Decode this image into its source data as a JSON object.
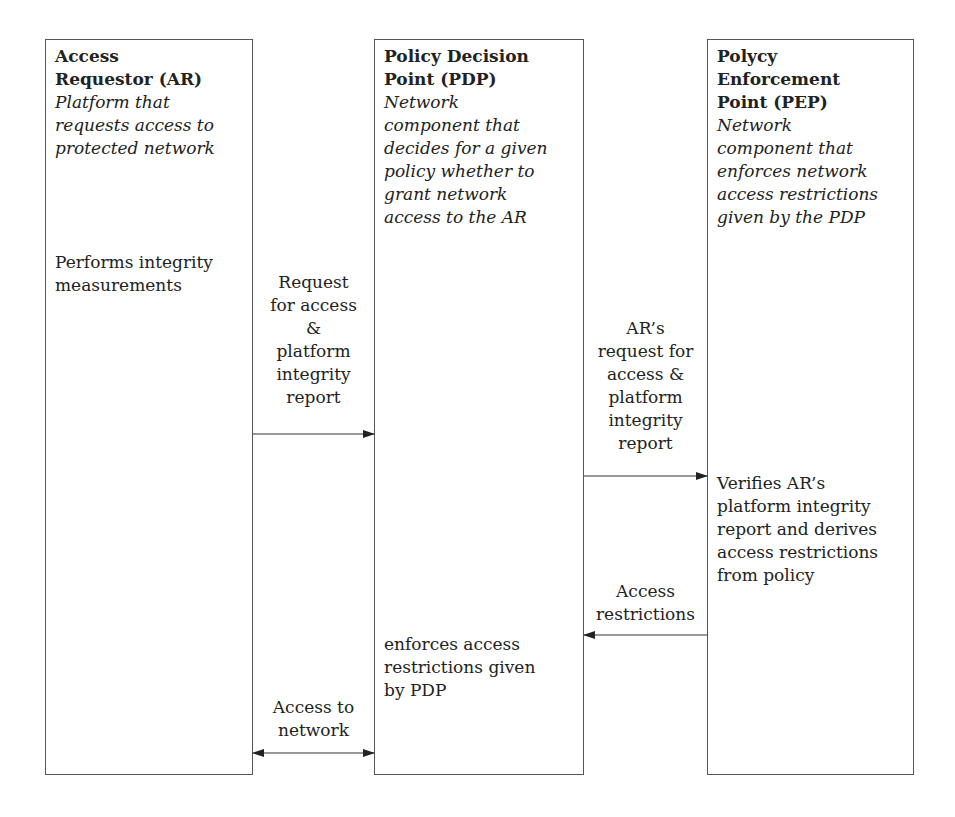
{
  "components": [
    {
      "title": "Access\nRequestor (AR)",
      "description": "Platform that\nrequests access to\nprotected network",
      "action": "Performs integrity\nmeasurements"
    },
    {
      "title": "Policy Decision\nPoint (PDP)",
      "description": "Network\ncomponent that\ndecides for a given\npolicy whether to\ngrant network\naccess to the AR",
      "action": "enforces access\nrestrictions given\nby PDP"
    },
    {
      "title": "Polycy\nEnforcement\nPoint (PEP)",
      "description": "Network\ncomponent that\nenforces network\naccess restrictions\ngiven by the PDP",
      "action": "Verifies AR’s\nplatform integrity\nreport and derives\naccess restrictions\nfrom policy"
    }
  ],
  "messages": [
    {
      "label": "Request\nfor access\n&\nplatform\nintegrity\nreport",
      "from": "AR",
      "to": "PDP",
      "direction": "right"
    },
    {
      "label": "AR’s\nrequest for\naccess &\nplatform\nintegrity\nreport",
      "from": "PDP",
      "to": "PEP",
      "direction": "right"
    },
    {
      "label": "Access\nrestrictions",
      "from": "PEP",
      "to": "PDP",
      "direction": "left"
    },
    {
      "label": "Access to\nnetwork",
      "from": "AR",
      "to": "PDP",
      "direction": "both"
    }
  ]
}
